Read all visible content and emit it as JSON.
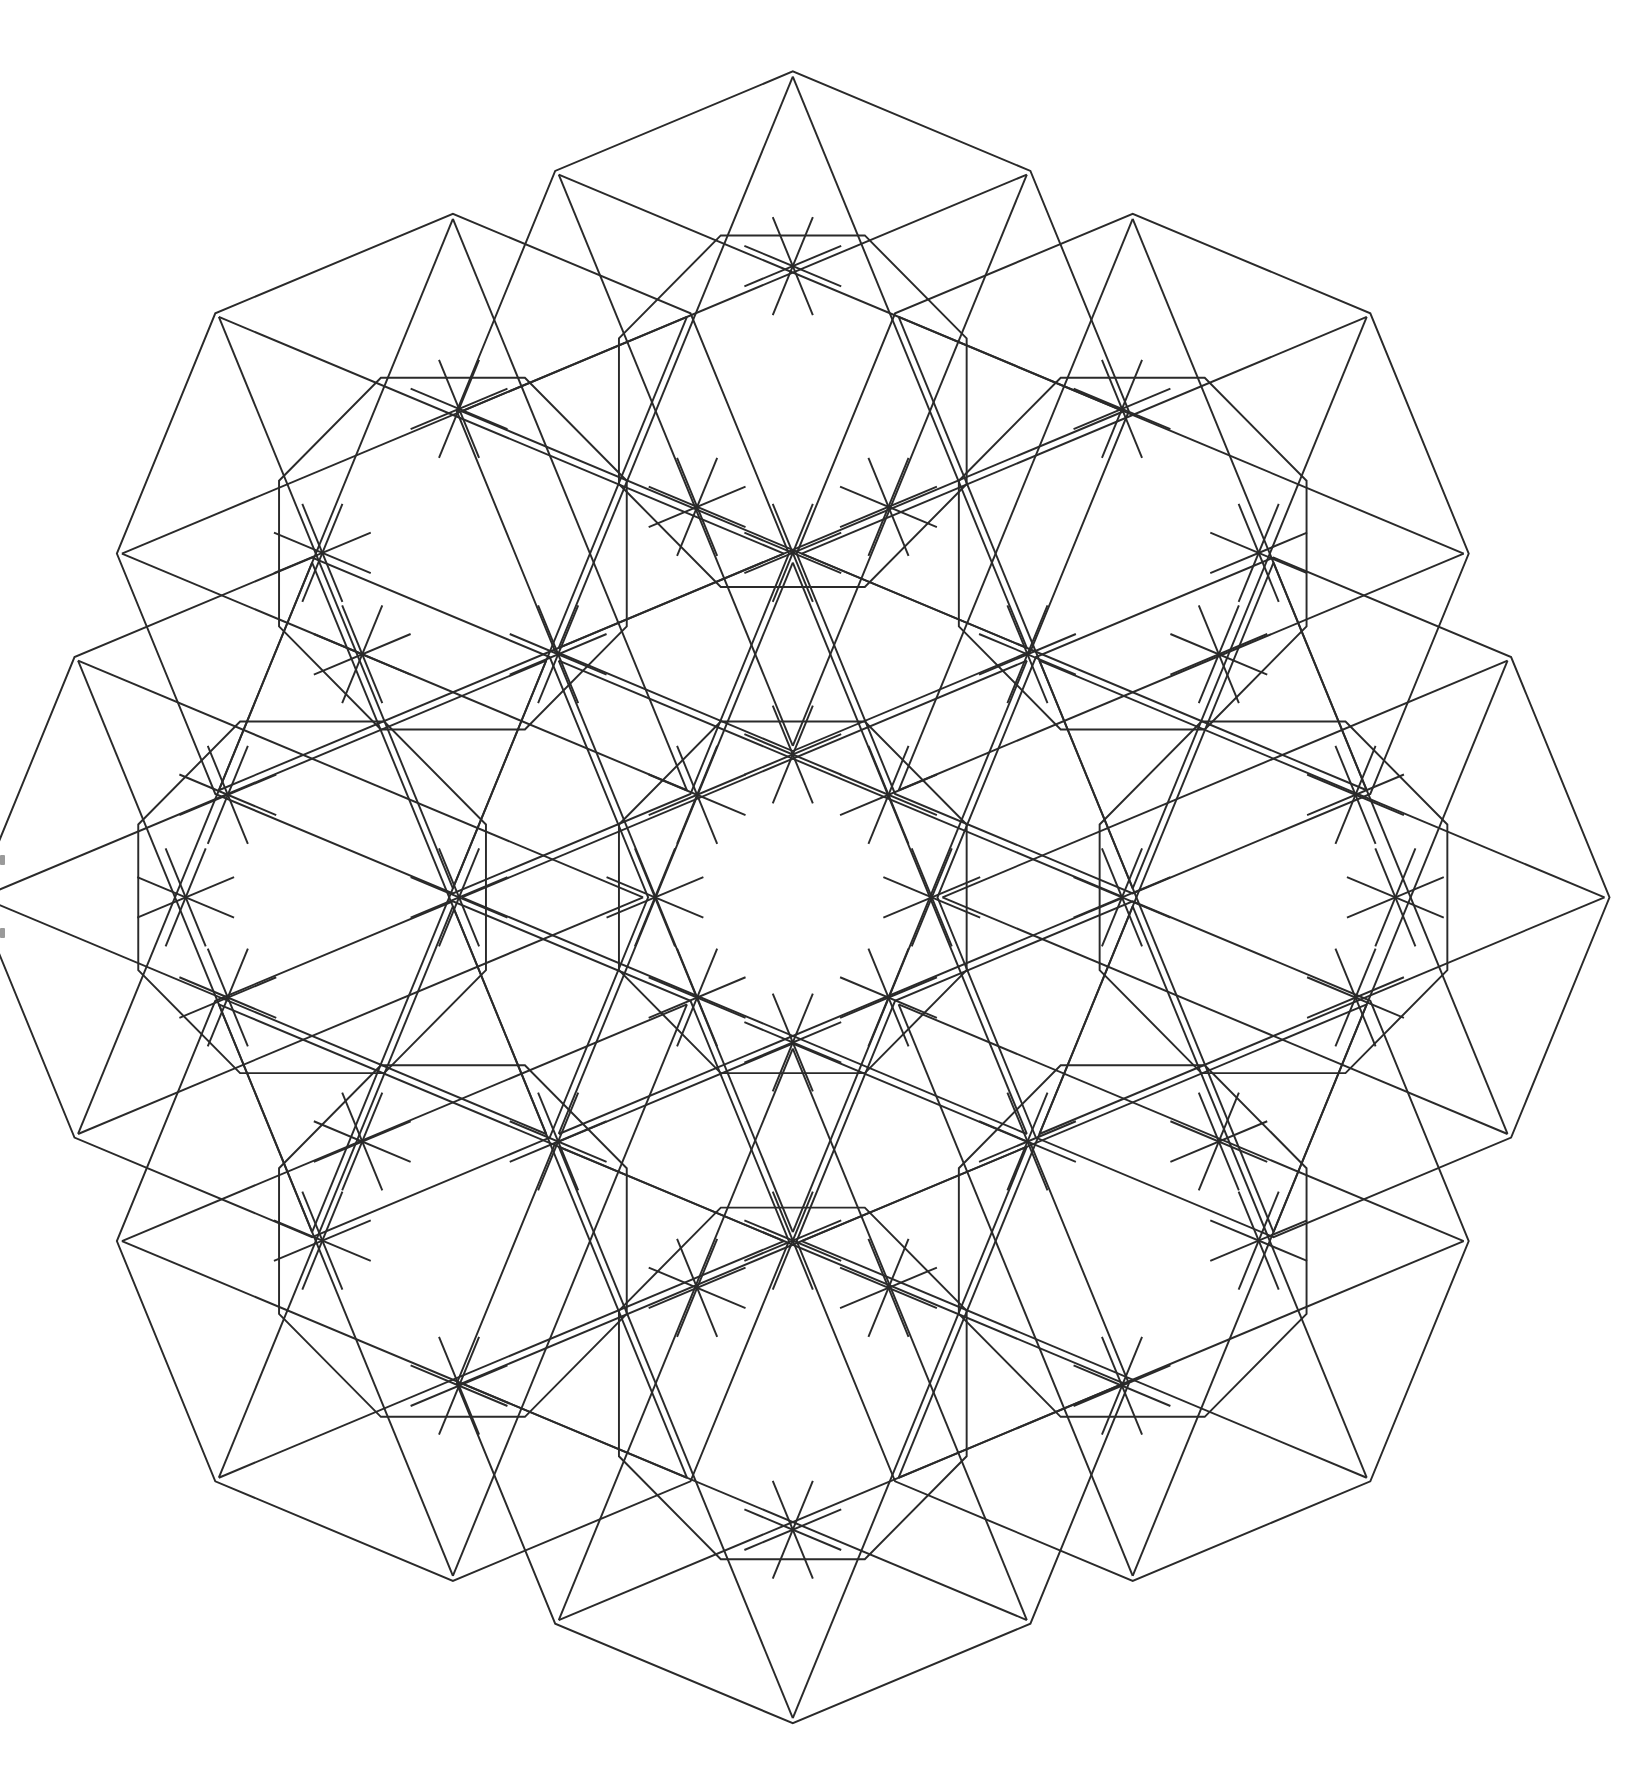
{
  "figure": {
    "title": "Geometric 8-fold star lattice coloring pattern",
    "background_color": "#ffffff",
    "stroke_color": "#2a2a2a",
    "stroke_width": 1.7,
    "viewbox": {
      "width": 1438,
      "height": 1534
    },
    "center": {
      "x": 696,
      "y": 779
    },
    "symmetry_order": 8,
    "unit_octagon": {
      "circumradius": 295,
      "vertex_start_angle_deg": 0,
      "inner_petal_ratio": 0.56,
      "inner_petal_rotation_deg": 22.5,
      "star_step": 3
    },
    "ring": {
      "radius": 422,
      "unit_angles_deg": [
        0,
        45,
        90,
        135,
        180,
        225,
        270,
        315
      ]
    },
    "measured_outer_apexes": [
      {
        "name": "top",
        "x": 696,
        "y": 56
      },
      {
        "name": "top-right",
        "x": 985,
        "y": 180
      },
      {
        "name": "right",
        "x": 1395,
        "y": 779
      },
      {
        "name": "bottom-right",
        "x": 1275,
        "y": 1075
      },
      {
        "name": "bottom",
        "x": 697,
        "y": 1531
      },
      {
        "name": "bottom-left",
        "x": 405,
        "y": 1380
      },
      {
        "name": "left",
        "x": 3,
        "y": 779
      },
      {
        "name": "top-left",
        "x": 403,
        "y": 181
      }
    ],
    "measured_hubs": [
      [
        696,
        231
      ],
      [
        696,
        480
      ],
      [
        696,
        655
      ],
      [
        696,
        905
      ],
      [
        696,
        1077
      ],
      [
        696,
        1328
      ],
      [
        612,
        440
      ],
      [
        780,
        440
      ],
      [
        612,
        690
      ],
      [
        780,
        690
      ],
      [
        612,
        866
      ],
      [
        780,
        866
      ],
      [
        612,
        1118
      ],
      [
        780,
        1118
      ],
      [
        490,
        568
      ],
      [
        902,
        568
      ],
      [
        490,
        991
      ],
      [
        902,
        991
      ],
      [
        403,
        355
      ],
      [
        985,
        355
      ],
      [
        403,
        779
      ],
      [
        985,
        779
      ],
      [
        403,
        1203
      ],
      [
        985,
        1203
      ],
      [
        575,
        779
      ],
      [
        818,
        779
      ],
      [
        318,
        568
      ],
      [
        1070,
        568
      ],
      [
        318,
        991
      ],
      [
        1070,
        991
      ],
      [
        283,
        480
      ],
      [
        1105,
        480
      ],
      [
        283,
        1077
      ],
      [
        1105,
        1077
      ],
      [
        200,
        690
      ],
      [
        1190,
        690
      ],
      [
        200,
        866
      ],
      [
        1190,
        866
      ],
      [
        163,
        779
      ],
      [
        1225,
        779
      ]
    ],
    "specks": [
      {
        "x": 0,
        "y": 742,
        "w": 5,
        "h": 10
      },
      {
        "x": 0,
        "y": 806,
        "w": 5,
        "h": 10
      }
    ]
  }
}
